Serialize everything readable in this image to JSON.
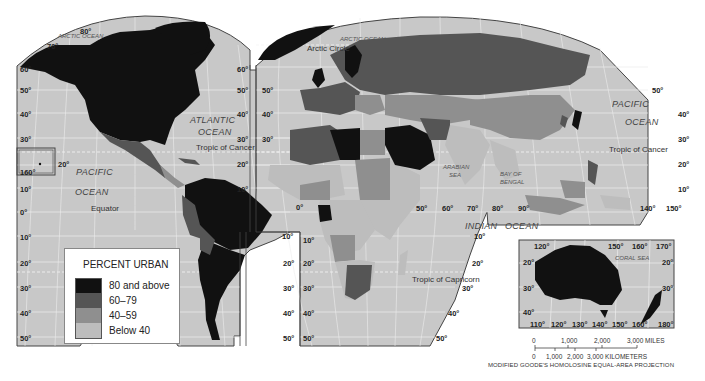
{
  "map": {
    "title": "Percent Urban (world map)",
    "projection_note": "MODIFIED GOODE'S HOMOLOSINE EQUAL-AREA PROJECTION",
    "colors": {
      "ocean": "#c8c8c8",
      "grid": "#eeeeee",
      "class_80_above": "#111111",
      "class_60_79": "#555555",
      "class_40_59": "#8f8f8f",
      "class_below_40": "#bdbdbd",
      "border": "#444444"
    },
    "ocean_labels": {
      "arctic_ocean_left": "ARCTIC OCEAN",
      "arctic_ocean_right": "ARCTIC OCEAN",
      "atlantic_1": "ATLANTIC",
      "atlantic_2": "OCEAN",
      "pacific_left_1": "PACIFIC",
      "pacific_left_2": "OCEAN",
      "pacific_right_1": "PACIFIC",
      "pacific_right_2": "OCEAN",
      "indian_1": "INDIAN",
      "indian_2": "OCEAN",
      "arabian_sea_1": "ARABIAN",
      "arabian_sea_2": "SEA",
      "bay_of_bengal_1": "BAY OF",
      "bay_of_bengal_2": "BENGAL",
      "coral_sea": "CORAL SEA"
    },
    "line_labels": {
      "arctic_circle": "Arctic Circle",
      "tropic_cancer_left": "Tropic of Cancer",
      "tropic_cancer_right": "Tropic of Cancer",
      "equator": "Equator",
      "tropic_capricorn": "Tropic of Capricorn"
    },
    "latitude_labels": {
      "left_edge": [
        "70°",
        "60°",
        "50°",
        "40°",
        "30°",
        "20°",
        "10°",
        "0°",
        "10°",
        "20°",
        "30°",
        "40°",
        "50°"
      ],
      "top_left": "80°",
      "hawaii_lat": "20°",
      "hawaii_lon": "160°",
      "na_right": [
        "60°",
        "50°",
        "40°",
        "30°",
        "20°",
        "10°"
      ],
      "sa_right": [
        "10°",
        "20°",
        "30°",
        "40°",
        "50°"
      ],
      "africa_left": [
        "10°",
        "20°",
        "30°",
        "40°",
        "50°"
      ],
      "europe_left": [
        "50°",
        "40°",
        "30°"
      ],
      "africa_right": [
        "10°",
        "20°",
        "30°",
        "40°",
        "50°"
      ],
      "asia_right": [
        "50°",
        "40°",
        "30°",
        "20°",
        "10°"
      ],
      "prime_meridian": "0°"
    },
    "longitude_labels": {
      "indian_ocean": [
        "50°",
        "60°",
        "70°",
        "80°",
        "90°"
      ],
      "se_asia": [
        "140°",
        "150°"
      ]
    },
    "inset_australia": {
      "top_lon": [
        "120°",
        "150°",
        "160°",
        "170°"
      ],
      "bottom_lon": [
        "110°",
        "120°",
        "130°",
        "140°",
        "150°",
        "160°",
        "180°"
      ],
      "left_lat": [
        "20°",
        "30°",
        "40°"
      ],
      "right_lat": [
        "20°",
        "30°"
      ]
    }
  },
  "legend": {
    "title": "PERCENT URBAN",
    "items": [
      {
        "label": "80 and above",
        "color": "#111111"
      },
      {
        "label": "60–79",
        "color": "#555555"
      },
      {
        "label": "40–59",
        "color": "#8f8f8f"
      },
      {
        "label": "Below 40",
        "color": "#bdbdbd"
      }
    ]
  },
  "scale_bar": {
    "miles": [
      "0",
      "1,000",
      "2,000",
      "3,000 MILES"
    ],
    "kilometers": [
      "0",
      "1,000",
      "2,000",
      "3,000 KILOMETERS"
    ]
  }
}
